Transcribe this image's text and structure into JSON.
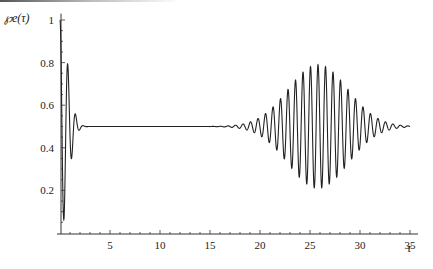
{
  "chart_data": {
    "type": "line",
    "title": "",
    "ylabel": "℘e(τ)",
    "xlabel": "τ",
    "xlim": [
      0,
      35.8
    ],
    "ylim": [
      0,
      1.03
    ],
    "grid": false,
    "legend": null,
    "x_ticks": [
      5,
      10,
      15,
      20,
      25,
      30,
      35
    ],
    "x_tick_labels": [
      "5",
      "10",
      "15",
      "20",
      "25",
      "30",
      "35"
    ],
    "y_ticks": [
      0.2,
      0.4,
      0.6,
      0.8,
      1
    ],
    "y_tick_labels": [
      "0.2",
      "0.4",
      "0.6",
      "0.8",
      "1"
    ],
    "series": [
      {
        "name": "℘e(τ)",
        "color": "#222222",
        "description": "Collapse and revival of Rabi oscillations: fast damped oscillation near τ=0 collapsing to 0.5 by τ≈3, flat until τ≈15, revival envelope peaking near τ≈25.8 (max≈0.79, min≈0.22), decaying toward 0.5 by τ=35",
        "key_points": [
          {
            "x": 0.0,
            "y": 1.0
          },
          {
            "x": 0.4,
            "y": 0.03
          },
          {
            "x": 0.8,
            "y": 0.88
          },
          {
            "x": 1.2,
            "y": 0.23
          },
          {
            "x": 1.5,
            "y": 0.66
          },
          {
            "x": 1.8,
            "y": 0.41
          },
          {
            "x": 2.1,
            "y": 0.55
          },
          {
            "x": 2.4,
            "y": 0.48
          },
          {
            "x": 2.7,
            "y": 0.5
          },
          {
            "x": 10.0,
            "y": 0.5
          },
          {
            "x": 15.0,
            "y": 0.5
          },
          {
            "x": 18.0,
            "y": 0.53
          },
          {
            "x": 20.0,
            "y": 0.6
          },
          {
            "x": 22.0,
            "y": 0.68
          },
          {
            "x": 24.0,
            "y": 0.76
          },
          {
            "x": 25.8,
            "y": 0.79
          },
          {
            "x": 25.4,
            "y": 0.22
          },
          {
            "x": 28.0,
            "y": 0.74
          },
          {
            "x": 30.0,
            "y": 0.64
          },
          {
            "x": 32.0,
            "y": 0.57
          },
          {
            "x": 35.0,
            "y": 0.51
          }
        ],
        "model": {
          "initial": {
            "amplitude": 0.5,
            "decay_time": 1.0,
            "period": 0.78
          },
          "revival": {
            "center": 25.8,
            "width": 4.2,
            "amplitude": 0.29,
            "period": 0.75
          },
          "baseline": 0.5
        }
      }
    ]
  }
}
